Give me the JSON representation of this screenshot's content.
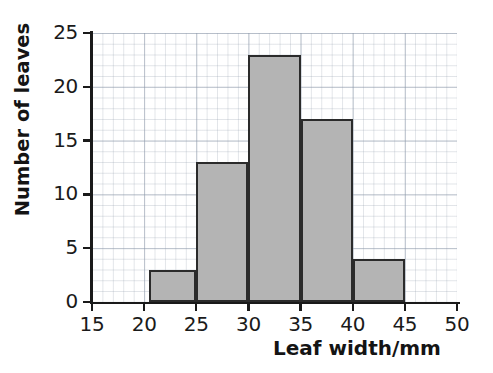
{
  "chart_data": {
    "type": "bar",
    "chart_subtype": "histogram",
    "title": "",
    "xlabel": "Leaf width/mm",
    "ylabel": "Number of leaves",
    "xlim": [
      15,
      50
    ],
    "ylim": [
      0,
      25
    ],
    "xticks": [
      15,
      20,
      25,
      30,
      35,
      40,
      45,
      50
    ],
    "yticks": [
      0,
      5,
      10,
      15,
      20,
      25
    ],
    "xtick_labels": [
      "15",
      "20",
      "25",
      "30",
      "35",
      "40",
      "45",
      "50"
    ],
    "ytick_labels": [
      "0",
      "5",
      "10",
      "15",
      "20",
      "25"
    ],
    "grid": true,
    "grid_minor_step_x": 1,
    "grid_minor_step_y": 1,
    "grid_major_step_x": 5,
    "grid_major_step_y": 5,
    "legend": false,
    "bin_edges": [
      20,
      25,
      30,
      35,
      40,
      45
    ],
    "categories": [
      "20-25",
      "25-30",
      "30-35",
      "35-40",
      "40-45"
    ],
    "values": [
      3,
      13,
      23,
      17,
      4
    ],
    "bars": [
      {
        "label": "20-25",
        "x_start": 20.5,
        "x_end": 25,
        "value": 3
      },
      {
        "label": "25-30",
        "x_start": 25,
        "x_end": 30,
        "value": 13
      },
      {
        "label": "30-35",
        "x_start": 30,
        "x_end": 35,
        "value": 23
      },
      {
        "label": "35-40",
        "x_start": 35,
        "x_end": 40,
        "value": 17
      },
      {
        "label": "40-45",
        "x_start": 40,
        "x_end": 45,
        "value": 4
      }
    ],
    "total": 60,
    "colors": {
      "bar_fill": "#b4b4b4",
      "bar_edge": "#2b2b2b",
      "axis": "#1a1a1a",
      "grid_minor": "#96a0af",
      "grid_major": "#8c98aa",
      "background": "#ffffff",
      "text": "#141414"
    }
  }
}
